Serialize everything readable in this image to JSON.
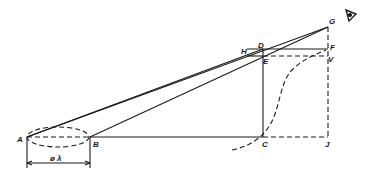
{
  "diagram": {
    "type": "geometric-perspective-construction",
    "stroke_color": "#1a1a1a",
    "background": "#ffffff",
    "points": {
      "A": {
        "label": "A",
        "x": 27,
        "y": 137
      },
      "B": {
        "label": "B",
        "x": 90,
        "y": 137
      },
      "C": {
        "label": "C",
        "x": 263,
        "y": 137
      },
      "J": {
        "label": "J",
        "x": 328,
        "y": 137
      },
      "D": {
        "label": "D",
        "x": 263,
        "y": 49
      },
      "E": {
        "label": "E",
        "x": 263,
        "y": 56
      },
      "H": {
        "label": "H",
        "x": 247,
        "y": 55
      },
      "F": {
        "label": "F",
        "x": 328,
        "y": 49
      },
      "V": {
        "label": "V",
        "x": 328,
        "y": 57
      },
      "G": {
        "label": "G",
        "x": 328,
        "y": 27
      }
    },
    "labels": {
      "A": "A",
      "B": "B",
      "C": "C",
      "D": "D",
      "E": "E",
      "F": "F",
      "G": "G",
      "H": "H",
      "J": "J",
      "V": "V",
      "dimension": "ø λ"
    },
    "eye_icon": "eye-icon"
  }
}
